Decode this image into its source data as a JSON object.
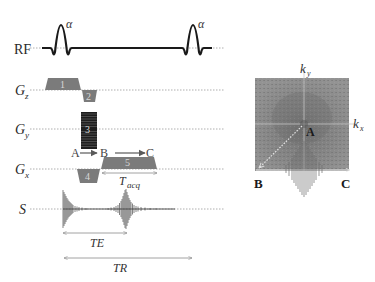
{
  "diagram": {
    "rows": [
      {
        "id": "rf",
        "label": "RF",
        "subscript": ""
      },
      {
        "id": "gz",
        "label": "G",
        "subscript": "z"
      },
      {
        "id": "gy",
        "label": "G",
        "subscript": "y"
      },
      {
        "id": "gx",
        "label": "G",
        "subscript": "x"
      },
      {
        "id": "s",
        "label": "S",
        "subscript": ""
      }
    ],
    "rf_pulses": [
      {
        "label": "α",
        "position": "first"
      },
      {
        "label": "α",
        "position": "second"
      }
    ],
    "gradient_lobes": [
      {
        "number": "1",
        "axis": "Gz",
        "polarity": "positive",
        "role": "slice select"
      },
      {
        "number": "2",
        "axis": "Gz",
        "polarity": "negative",
        "role": "slice rephase"
      },
      {
        "number": "3",
        "axis": "Gy",
        "polarity": "stepped",
        "role": "phase encode"
      },
      {
        "number": "4",
        "axis": "Gx",
        "polarity": "negative",
        "role": "readout prephase"
      },
      {
        "number": "5",
        "axis": "Gx",
        "polarity": "positive",
        "role": "readout"
      }
    ],
    "trajectory_labels": {
      "a": "A",
      "b": "B",
      "c": "C"
    },
    "timing": {
      "tacq": {
        "main": "T",
        "sub": "acq"
      },
      "te": "TE",
      "tr": "TR"
    },
    "kspace": {
      "ky_label": {
        "main": "k",
        "sub": "y"
      },
      "kx_label": {
        "main": "k",
        "sub": "x"
      },
      "point_a": "A",
      "point_b": "B",
      "point_c": "C"
    },
    "colors": {
      "gradient_fill": "#7b7b7b",
      "phase_encode_fill": "#1e1e1e",
      "rf_line": "#1a1a1a",
      "signal": "#555555",
      "kspace_bg": "#8c8c8c",
      "baseline": "#9a9a9a"
    }
  }
}
